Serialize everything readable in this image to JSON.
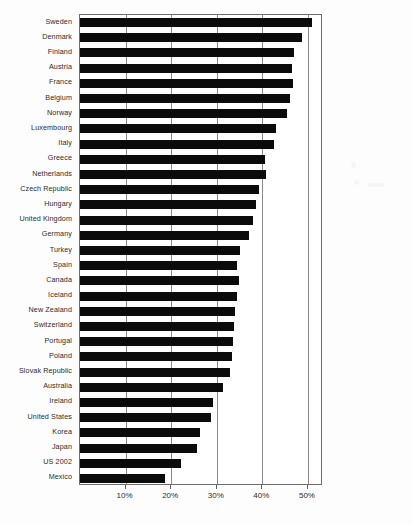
{
  "chart_data": {
    "type": "bar",
    "orientation": "horizontal",
    "title": "",
    "subtitle": "",
    "xlabel": "",
    "ylabel": "",
    "xlim": [
      0,
      53.3
    ],
    "ylim": null,
    "grid": true,
    "legend": null,
    "legend_position": "none",
    "bar_color": "#0b0b0b",
    "background_color": "#ffffff",
    "axis_color": "#6d6d6d",
    "tick_labels": [
      "10%",
      "20%",
      "30%",
      "40%",
      "50%"
    ],
    "tick_values": [
      10,
      20,
      30,
      40,
      50
    ],
    "categories": [
      "Sweden",
      "Denmark",
      "Finland",
      "Austria",
      "France",
      "Belgium",
      "Norway",
      "Luxembourg",
      "Italy",
      "Greece",
      "Netherlands",
      "Czech Republic",
      "Hungary",
      "United Kingdom",
      "Germany",
      "Turkey",
      "Spain",
      "Canada",
      "Iceland",
      "New Zealand",
      "Switzerland",
      "Portugal",
      "Poland",
      "Slovak Republic",
      "Australia",
      "Ireland",
      "United States",
      "Korea",
      "Japan",
      "US 2002",
      "Mexico"
    ],
    "values": [
      50.9,
      48.8,
      47.0,
      46.5,
      46.7,
      46.0,
      45.4,
      43.0,
      42.5,
      40.5,
      40.8,
      39.2,
      38.6,
      38.0,
      37.0,
      35.0,
      34.5,
      34.8,
      34.4,
      34.0,
      33.8,
      33.5,
      33.3,
      33.0,
      31.3,
      29.1,
      28.7,
      26.3,
      25.6,
      22.1,
      18.6
    ]
  }
}
